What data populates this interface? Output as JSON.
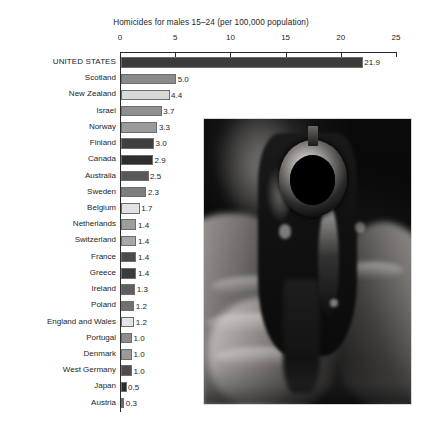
{
  "chart_data": {
    "type": "bar",
    "orientation": "horizontal",
    "title": "Homicides for males 15–24 (per 100,000 population)",
    "xlabel": "",
    "ylabel": "",
    "xlim": [
      0,
      25
    ],
    "xticks": [
      0,
      5,
      10,
      15,
      20,
      25
    ],
    "xtick_labels": [
      "0",
      "5",
      "10",
      "15",
      "20",
      "25"
    ],
    "grid": false,
    "legend": false,
    "categories": [
      "UNITED STATES",
      "Scotland",
      "New Zealand",
      "Israel",
      "Norway",
      "Finland",
      "Canada",
      "Australia",
      "Sweden",
      "Belgium",
      "Netherlands",
      "Switzerland",
      "France",
      "Greece",
      "Ireland",
      "Poland",
      "England and Wales",
      "Portugal",
      "Denmark",
      "West Germany",
      "Japan",
      "Austria"
    ],
    "values": [
      21.9,
      5.0,
      4.4,
      3.7,
      3.3,
      3.0,
      2.9,
      2.5,
      2.3,
      1.7,
      1.4,
      1.4,
      1.4,
      1.4,
      1.3,
      1.2,
      1.2,
      1.0,
      1.0,
      1.0,
      0.5,
      0.3
    ],
    "value_labels": [
      "21.9",
      "5.0",
      "4.4",
      "3.7",
      "3.3",
      "3.0",
      "2.9",
      "2.5",
      "2.3",
      "1.7",
      "1.4",
      "1.4",
      "1.4",
      "1.4",
      "1.3",
      "1.2",
      "1.2",
      "1.0",
      "1.0",
      "1.0",
      "0.5",
      "0.3"
    ],
    "bar_colors": [
      "#3b3b3b",
      "#8a8a8a",
      "#d9d9d9",
      "#8f8f8f",
      "#9b9b9b",
      "#3f3f3f",
      "#2e2e2e",
      "#585858",
      "#7d7d7d",
      "#e2e2e2",
      "#9d9d9d",
      "#a8a8a8",
      "#4a4a4a",
      "#3a3a3a",
      "#5e5e5e",
      "#707070",
      "#e4e4e4",
      "#8d8d8d",
      "#9a9a9a",
      "#4d4d4d",
      "#2c2c2c",
      "#6a6a6a"
    ]
  },
  "photo": {
    "alt": "Black and white photograph of a hand holding a revolver pointed toward the viewer",
    "name": "revolver-photo"
  }
}
